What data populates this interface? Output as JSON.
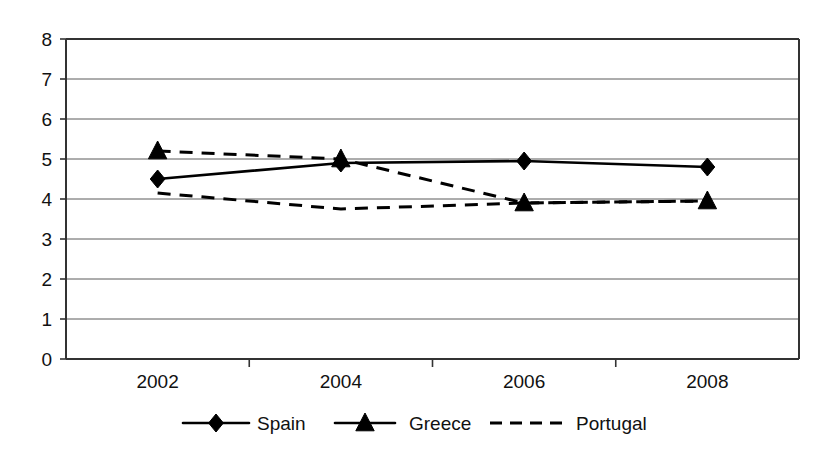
{
  "chart_data": {
    "type": "line",
    "title": "",
    "xlabel": "",
    "ylabel": "",
    "categories": [
      "2002",
      "2004",
      "2006",
      "2008"
    ],
    "ylim": [
      0,
      8
    ],
    "y_ticks": [
      "0",
      "1",
      "2",
      "3",
      "4",
      "5",
      "6",
      "7",
      "8"
    ],
    "grid": true,
    "legend_position": "bottom",
    "series": [
      {
        "name": "Spain",
        "marker": "diamond",
        "line_style": "solid",
        "values": [
          4.5,
          4.9,
          4.95,
          4.8
        ]
      },
      {
        "name": "Greece",
        "marker": "triangle",
        "line_style": "dashed",
        "values": [
          5.2,
          5.0,
          3.9,
          3.95
        ]
      },
      {
        "name": "Portugal",
        "marker": "none",
        "line_style": "dashed",
        "values": [
          4.15,
          3.75,
          3.9,
          3.95
        ]
      }
    ]
  },
  "legend": {
    "items": [
      {
        "label": "Spain",
        "marker": "diamond",
        "line_style": "solid"
      },
      {
        "label": "Greece",
        "marker": "triangle",
        "line_style": "solid"
      },
      {
        "label": "Portugal",
        "marker": "none",
        "line_style": "dashed"
      }
    ]
  },
  "colors": {
    "series": "#000000",
    "gridline": "#5a5a5a",
    "axis": "#333333",
    "background": "#ffffff",
    "text": "#111111"
  }
}
